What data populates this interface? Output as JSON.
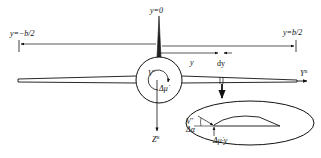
{
  "labels": {
    "y_zero": "y=0",
    "y_neg_half_span": "y=−b/2",
    "y_pos_half_span": "y=b/2",
    "y_distance": "y",
    "dy": "dy",
    "axis_y": "Y",
    "axis_y_sup": "B",
    "axis_z": "Z",
    "axis_z_sup": "B",
    "velocity": "V",
    "velocity_sup": "*",
    "roll_increment": "Δμ̇",
    "section_velocity": "V",
    "section_velocity_sup": "*",
    "delta_alpha": "Δα",
    "section_roll_term": "Δμ̇·y"
  },
  "colors": {
    "stroke": "#111111",
    "background": "#ffffff"
  }
}
